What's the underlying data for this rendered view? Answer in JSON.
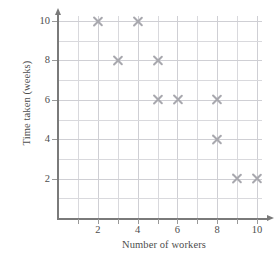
{
  "chart_data": {
    "type": "scatter",
    "title": "",
    "xlabel": "Number of workers",
    "ylabel": "Time taken (weeks)",
    "xlim": [
      0,
      10.6
    ],
    "ylim": [
      0,
      10.6
    ],
    "xticks": [
      2,
      4,
      6,
      8,
      10
    ],
    "yticks": [
      2,
      4,
      6,
      8,
      10
    ],
    "x_minor_step": 1,
    "y_minor_step": 1,
    "grid": true,
    "legend": null,
    "marker": "x",
    "marker_color": "#a8a8ae",
    "grid_color": "#d9d9dd",
    "axis_color": "#7a7a7a",
    "points": [
      {
        "x": 2,
        "y": 10
      },
      {
        "x": 4,
        "y": 10
      },
      {
        "x": 3,
        "y": 8
      },
      {
        "x": 5,
        "y": 8
      },
      {
        "x": 5,
        "y": 6
      },
      {
        "x": 6,
        "y": 6
      },
      {
        "x": 8,
        "y": 6
      },
      {
        "x": 8,
        "y": 4
      },
      {
        "x": 9,
        "y": 2
      },
      {
        "x": 10,
        "y": 2
      }
    ],
    "x": [
      2,
      4,
      3,
      5,
      5,
      6,
      8,
      8,
      9,
      10
    ],
    "y": [
      10,
      10,
      8,
      8,
      6,
      6,
      6,
      4,
      2,
      2
    ]
  }
}
